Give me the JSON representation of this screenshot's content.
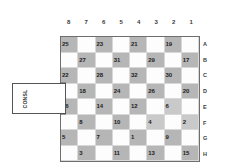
{
  "board": {
    "column_headers": [
      "8",
      "7",
      "6",
      "5",
      "4",
      "3",
      "2",
      "1"
    ],
    "row_labels": [
      "A",
      "B",
      "C",
      "D",
      "E",
      "F",
      "G",
      "H"
    ],
    "rows": [
      {
        "label": "A",
        "cells": [
          {
            "value": "25",
            "shaded": true
          },
          {
            "value": "",
            "shaded": false
          },
          {
            "value": "23",
            "shaded": true
          },
          {
            "value": "",
            "shaded": false
          },
          {
            "value": "21",
            "shaded": true
          },
          {
            "value": "",
            "shaded": false
          },
          {
            "value": "19",
            "shaded": true
          },
          {
            "value": "",
            "shaded": false
          }
        ]
      },
      {
        "label": "B",
        "cells": [
          {
            "value": "",
            "shaded": false
          },
          {
            "value": "27",
            "shaded": true
          },
          {
            "value": "",
            "shaded": false
          },
          {
            "value": "31",
            "shaded": true
          },
          {
            "value": "",
            "shaded": false
          },
          {
            "value": "29",
            "shaded": true
          },
          {
            "value": "",
            "shaded": false
          },
          {
            "value": "17",
            "shaded": true
          }
        ]
      },
      {
        "label": "C",
        "cells": [
          {
            "value": "22",
            "shaded": true
          },
          {
            "value": "",
            "shaded": false
          },
          {
            "value": "28",
            "shaded": true
          },
          {
            "value": "",
            "shaded": false
          },
          {
            "value": "32",
            "shaded": true
          },
          {
            "value": "",
            "shaded": false
          },
          {
            "value": "30",
            "shaded": true
          },
          {
            "value": "",
            "shaded": false
          }
        ]
      },
      {
        "label": "D",
        "cells": [
          {
            "value": "",
            "shaded": false
          },
          {
            "value": "18",
            "shaded": true
          },
          {
            "value": "",
            "shaded": false
          },
          {
            "value": "24",
            "shaded": true
          },
          {
            "value": "",
            "shaded": false
          },
          {
            "value": "26",
            "shaded": true
          },
          {
            "value": "",
            "shaded": false
          },
          {
            "value": "20",
            "shaded": true
          }
        ]
      },
      {
        "label": "E",
        "cells": [
          {
            "value": "16",
            "shaded": true
          },
          {
            "value": "",
            "shaded": false
          },
          {
            "value": "14",
            "shaded": true
          },
          {
            "value": "",
            "shaded": false
          },
          {
            "value": "12",
            "shaded": true
          },
          {
            "value": "",
            "shaded": false
          },
          {
            "value": "6",
            "shaded": true
          },
          {
            "value": "",
            "shaded": false
          }
        ]
      },
      {
        "label": "F",
        "cells": [
          {
            "value": "",
            "shaded": false
          },
          {
            "value": "8",
            "shaded": true
          },
          {
            "value": "",
            "shaded": false
          },
          {
            "value": "10",
            "shaded": true
          },
          {
            "value": "",
            "shaded": false
          },
          {
            "value": "4",
            "shaded": true
          },
          {
            "value": "",
            "shaded": false
          },
          {
            "value": "2",
            "shaded": true
          }
        ]
      },
      {
        "label": "G",
        "cells": [
          {
            "value": "5",
            "shaded": true
          },
          {
            "value": "",
            "shaded": false
          },
          {
            "value": "7",
            "shaded": true
          },
          {
            "value": "",
            "shaded": false
          },
          {
            "value": "1",
            "shaded": true
          },
          {
            "value": "",
            "shaded": false
          },
          {
            "value": "9",
            "shaded": true
          },
          {
            "value": "",
            "shaded": false
          }
        ]
      },
      {
        "label": "H",
        "cells": [
          {
            "value": "",
            "shaded": false
          },
          {
            "value": "3",
            "shaded": true
          },
          {
            "value": "",
            "shaded": false
          },
          {
            "value": "11",
            "shaded": true
          },
          {
            "value": "",
            "shaded": false
          },
          {
            "value": "13",
            "shaded": true
          },
          {
            "value": "",
            "shaded": false
          },
          {
            "value": "15",
            "shaded": true
          }
        ]
      }
    ]
  },
  "callout": {
    "label": "CONSL"
  },
  "colors": {
    "shaded_cell": "#b6b6b6",
    "empty_cell": "#fdfdfd",
    "board_border": "#6e6e6e",
    "grid_line": "#d8d8d8",
    "text": "#1d1d1d"
  }
}
